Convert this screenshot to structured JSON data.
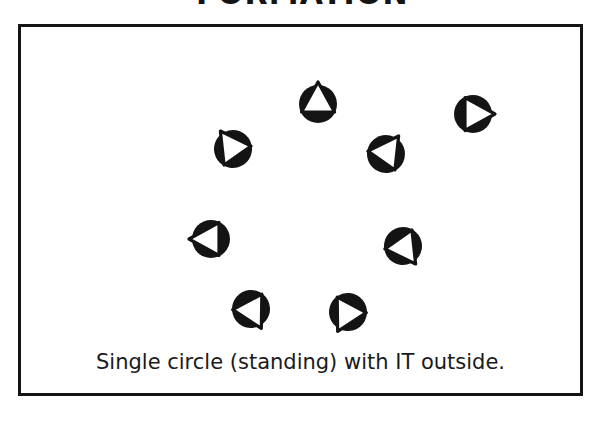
{
  "title": "FORMATION",
  "panel": {
    "caption": "Single circle (standing) with IT outside.",
    "border_color": "#141414",
    "background_color": "#ffffff"
  },
  "marker_style": {
    "disc_color": "#141414",
    "triangle_fill": "#ffffff",
    "triangle_stroke": "#141414",
    "description": "filled black disc with outlined triangle indicating facing direction"
  },
  "diagram": {
    "shape": "single circle",
    "participant_count": 8,
    "facing": "inward",
    "markers": [
      {
        "id": "person-1",
        "label": "person 1",
        "x": 300,
        "y": 80,
        "rotation": 180,
        "facing": "down"
      },
      {
        "id": "person-2",
        "label": "person 2",
        "x": 455,
        "y": 90,
        "rotation": 270,
        "facing": "left"
      },
      {
        "id": "person-3",
        "label": "person 3",
        "x": 215,
        "y": 125,
        "rotation": 145,
        "facing": "down-right"
      },
      {
        "id": "person-4",
        "label": "person 4",
        "x": 368,
        "y": 130,
        "rotation": 215,
        "facing": "down-left"
      },
      {
        "id": "person-5",
        "label": "person 5",
        "x": 193,
        "y": 215,
        "rotation": 90,
        "facing": "right"
      },
      {
        "id": "person-6",
        "label": "person 6",
        "x": 385,
        "y": 222,
        "rotation": 325,
        "facing": "up-left"
      },
      {
        "id": "person-7",
        "label": "person 7",
        "x": 233,
        "y": 285,
        "rotation": 332,
        "facing": "up-left"
      },
      {
        "id": "person-8",
        "label": "person 8",
        "x": 330,
        "y": 288,
        "rotation": 28,
        "facing": "up-right"
      }
    ]
  }
}
